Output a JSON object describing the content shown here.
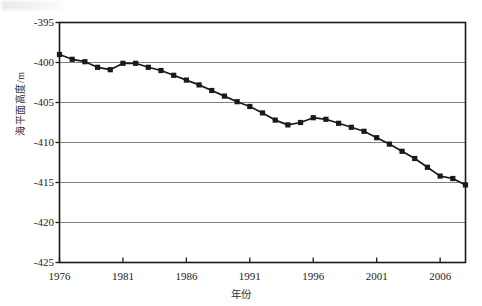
{
  "chart_data": {
    "type": "line",
    "title": "",
    "xlabel": "年份",
    "ylabel": "海平面高度/m",
    "xlim": [
      1976,
      2008
    ],
    "ylim": [
      -425,
      -395
    ],
    "grid": true,
    "legend": null,
    "marker": "square",
    "line_color": "#1a1a1a",
    "marker_color": "#1a1a1a",
    "grid_color": "#808080",
    "axis_color": "#1a1a1a",
    "xticks": [
      "1976",
      "1981",
      "1986",
      "1991",
      "1996",
      "2001",
      "2006"
    ],
    "xtick_values": [
      1976,
      1981,
      1986,
      1991,
      1996,
      2001,
      2006
    ],
    "yticks": [
      "-395",
      "-400",
      "-405",
      "-410",
      "-415",
      "-420",
      "-425"
    ],
    "ytick_values": [
      -395,
      -400,
      -405,
      -410,
      -415,
      -420,
      -425
    ],
    "x": [
      1976,
      1977,
      1978,
      1979,
      1980,
      1981,
      1982,
      1983,
      1984,
      1985,
      1986,
      1987,
      1988,
      1989,
      1990,
      1991,
      1992,
      1993,
      1994,
      1995,
      1996,
      1997,
      1998,
      1999,
      2000,
      2001,
      2002,
      2003,
      2004,
      2005,
      2006,
      2007,
      2008
    ],
    "values": [
      -399.0,
      -399.6,
      -399.9,
      -400.6,
      -400.9,
      -400.1,
      -400.1,
      -400.6,
      -401.0,
      -401.6,
      -402.2,
      -402.8,
      -403.5,
      -404.2,
      -404.9,
      -405.5,
      -406.3,
      -407.2,
      -407.8,
      -407.5,
      -406.9,
      -407.1,
      -407.6,
      -408.1,
      -408.6,
      -409.4,
      -410.2,
      -411.1,
      -412.0,
      -413.1,
      -414.2,
      -414.5,
      -415.3
    ],
    "series_extra_x": [
      2004.5,
      2005.5,
      2006.5,
      2007.0,
      2007.6,
      2008.0
    ],
    "note_points": 33,
    "annotations": []
  },
  "axis": {
    "x_label": "年份",
    "y_label": "海平面高度/m"
  }
}
